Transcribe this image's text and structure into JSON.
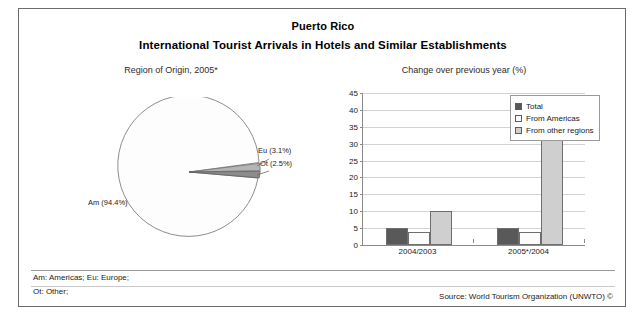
{
  "header": {
    "title": "Puerto Rico",
    "subtitle": "International Tourist Arrivals in Hotels and Similar Establishments"
  },
  "panels": {
    "pie_caption": "Region of Origin, 2005*",
    "bar_caption": "Change over previous year (%)"
  },
  "footer": {
    "abbrev_line_1": "Am: Americas; Eu: Europe;",
    "abbrev_line_2": "Ot: Other;",
    "source": "Source: World Tourism Organization (UNWTO) ©"
  },
  "colors": {
    "total": "#595959",
    "from_americas": "#fbfbfb",
    "from_other_regions": "#cfcfcf",
    "frame": "#6b6b6b",
    "grid": "#d2d2d2",
    "axis": "#8a8a8a"
  },
  "chart_data": [
    {
      "type": "pie",
      "title": "Region of Origin, 2005*",
      "labels": [
        "Am",
        "Eu",
        "Ot"
      ],
      "slice_labels": [
        "Am (94.4%)",
        "Eu (3.1%)",
        "Ot (2.5%)"
      ],
      "values": [
        94.4,
        3.1,
        2.5
      ],
      "unit": "%",
      "legend": "none",
      "slice_colors": [
        "#fdfdfd",
        "#b9b9b9",
        "#8f8f8f"
      ]
    },
    {
      "type": "bar",
      "title": "Change over previous year (%)",
      "xlabel": "",
      "ylabel": "",
      "categories": [
        "2004/2003",
        "2005*/2004"
      ],
      "series": [
        {
          "name": "Total",
          "values": [
            5,
            5
          ],
          "color": "#595959"
        },
        {
          "name": "From Americas",
          "values": [
            4,
            4
          ],
          "color": "#fbfbfb"
        },
        {
          "name": "From other regions",
          "values": [
            10,
            42
          ],
          "color": "#cfcfcf"
        }
      ],
      "ylim": [
        0,
        45
      ],
      "yticks": [
        0,
        5,
        10,
        15,
        20,
        25,
        30,
        35,
        40,
        45
      ],
      "ytick_labels": [
        "0",
        "5",
        "10",
        "15",
        "20",
        "25",
        "30",
        "35",
        "40",
        "45"
      ],
      "grid": true,
      "legend_position": "top-right"
    }
  ]
}
